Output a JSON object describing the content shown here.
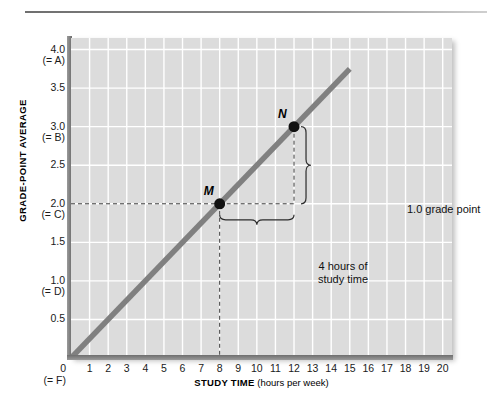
{
  "chart_data": {
    "type": "line",
    "title": "",
    "xlabel_bold": "STUDY TIME",
    "xlabel_rest": " (hours per week)",
    "ylabel": "GRADE-POINT AVERAGE",
    "xlim": [
      0,
      20.5
    ],
    "ylim": [
      0,
      4.15
    ],
    "grid": true,
    "legend": "none",
    "x_ticks": [
      1,
      2,
      3,
      4,
      5,
      6,
      7,
      8,
      9,
      10,
      11,
      12,
      13,
      14,
      15,
      16,
      17,
      18,
      19,
      20
    ],
    "x_tick_labels": [
      "1",
      "2",
      "3",
      "4",
      "5",
      "6",
      "7",
      "8",
      "9",
      "10",
      "11",
      "12",
      "13",
      "14",
      "15",
      "16",
      "17",
      "18",
      "19",
      "20"
    ],
    "x_origin_label": "0",
    "x_origin_grade": "(= F)",
    "y_ticks": [
      0.5,
      1.0,
      1.5,
      2.0,
      2.5,
      3.0,
      3.5,
      4.0
    ],
    "y_tick_labels": [
      {
        "value": "4.0",
        "grade": "(= A)",
        "y": 4.0
      },
      {
        "value": "3.5",
        "grade": "",
        "y": 3.5
      },
      {
        "value": "3.0",
        "grade": "(= B)",
        "y": 3.0
      },
      {
        "value": "2.5",
        "grade": "",
        "y": 2.5
      },
      {
        "value": "2.0",
        "grade": "(= C)",
        "y": 2.0
      },
      {
        "value": "1.5",
        "grade": "",
        "y": 1.5
      },
      {
        "value": "1.0",
        "grade": "(= D)",
        "y": 1.0
      },
      {
        "value": "0.5",
        "grade": "",
        "y": 0.5
      }
    ],
    "series": [
      {
        "name": "grade-point average vs study time",
        "line_color": "#808080",
        "x": [
          0,
          15.0
        ],
        "y": [
          0,
          3.75
        ]
      }
    ],
    "points": [
      {
        "label": "M",
        "x": 8,
        "y": 2.0
      },
      {
        "label": "N",
        "x": 12,
        "y": 3.0
      }
    ],
    "annotations": [
      {
        "name": "grade-point-rise",
        "text": "1.0 grade point"
      },
      {
        "name": "study-time-run",
        "line1": "4 hours of",
        "line2": "study time"
      }
    ],
    "colors": {
      "plot_background": "#dcdcdc",
      "gridline": "#ffffff",
      "line": "#808080",
      "point": "#111111",
      "axis": "#6e6e6e",
      "text": "#1a1a1a"
    }
  }
}
